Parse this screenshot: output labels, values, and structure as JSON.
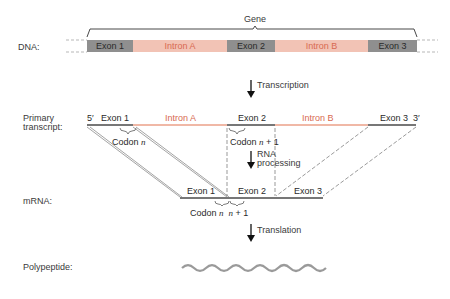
{
  "gene_label": "Gene",
  "row_labels": {
    "dna": "DNA:",
    "primary_line1": "Primary",
    "primary_line2": "transcript:",
    "mrna": "mRNA:",
    "polypeptide": "Polypeptide:"
  },
  "dna": {
    "segments": [
      {
        "label": "Exon 1",
        "type": "exon"
      },
      {
        "label": "Intron A",
        "type": "intron"
      },
      {
        "label": "Exon 2",
        "type": "exon"
      },
      {
        "label": "Intron B",
        "type": "intron"
      },
      {
        "label": "Exon 3",
        "type": "exon"
      }
    ]
  },
  "steps": {
    "transcription": "Transcription",
    "rna_processing_line1": "RNA",
    "rna_processing_line2": "processing",
    "translation": "Translation"
  },
  "primary": {
    "five_prime": "5′",
    "three_prime": "3′",
    "exon1": "Exon 1",
    "intron_a": "Intron A",
    "exon2": "Exon 2",
    "intron_b": "Intron B",
    "exon3": "Exon 3",
    "codon_n_prefix": "Codon",
    "codon_n_var": "n",
    "codon_n1_prefix": "Codon",
    "codon_n1_var": "n",
    "codon_n1_suffix": "+ 1"
  },
  "mrna": {
    "exon1": "Exon 1",
    "exon2": "Exon 2",
    "exon3": "Exon 3",
    "codon_prefix": "Codon",
    "codon_var": "n",
    "next_var": "n",
    "next_suffix": "+ 1"
  },
  "colors": {
    "exon": "#8f8f8f",
    "intron": "#f2c3b5",
    "intron_text": "#d86a52",
    "line": "#555555"
  }
}
